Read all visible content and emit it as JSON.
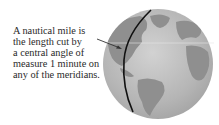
{
  "caption": {
    "lines": [
      "A nautical mile is",
      "the length cut by",
      "a central angle of",
      "measure 1 minute on",
      "any of the meridians."
    ]
  },
  "figure": {
    "icons": [
      "globe-icon",
      "arrow-icon",
      "meridian-line"
    ],
    "colors": {
      "ocean": "#b9b9b9",
      "land": "#8f8f8f",
      "meridian": "#111111",
      "text": "#2a2a2a"
    }
  }
}
